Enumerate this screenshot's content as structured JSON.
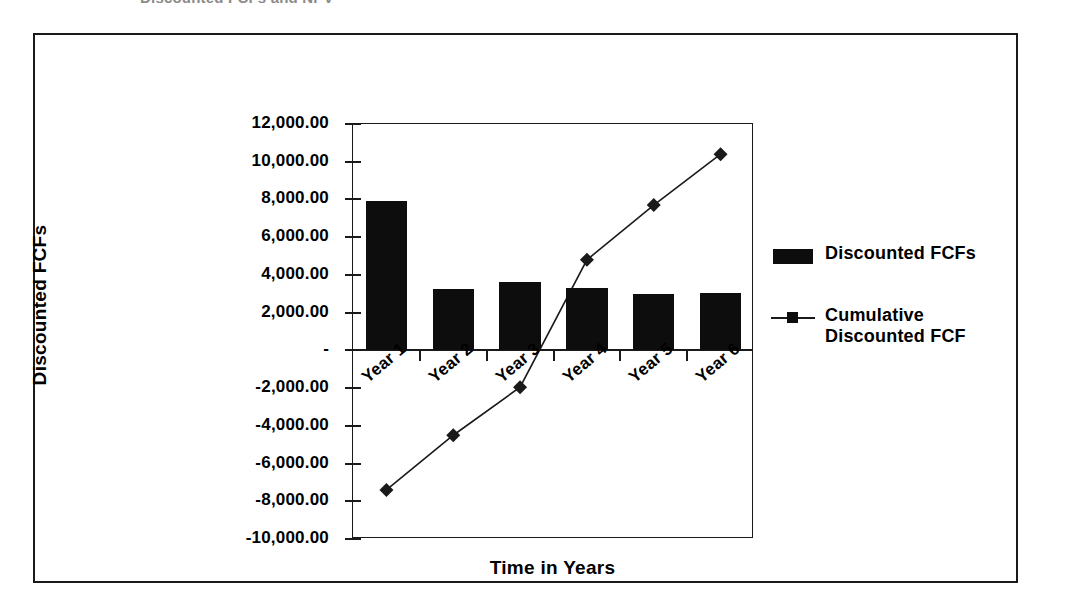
{
  "clipped_title": "Discounted FCFs and NPV",
  "chart_data": {
    "type": "bar",
    "title": "",
    "xlabel": "Time in Years",
    "ylabel": "Discounted FCFs",
    "categories": [
      "Year 1",
      "Year 2",
      "Year 3",
      "Year 4",
      "Year 5",
      "Year 6"
    ],
    "ylim": [
      -10000,
      12000
    ],
    "ytick_values": [
      12000,
      10000,
      8000,
      6000,
      4000,
      2000,
      0,
      -2000,
      -4000,
      -6000,
      -8000,
      -10000
    ],
    "ytick_labels": [
      "12,000.00",
      "10,000.00",
      "8,000.00",
      "6,000.00",
      "4,000.00",
      "2,000.00",
      "-",
      "-2,000.00",
      "-4,000.00",
      "-6,000.00",
      "-8,000.00",
      "-10,000.00"
    ],
    "grid": false,
    "legend_position": "right",
    "series": [
      {
        "name": "Discounted FCFs",
        "type": "bar",
        "color": "#0d0d0d",
        "values": [
          7900,
          3250,
          3650,
          3300,
          3000,
          3050
        ]
      },
      {
        "name": "Cumulative Discounted FCF",
        "type": "line",
        "color": "#1a1a1a",
        "marker": "diamond",
        "values": [
          -7400,
          -4500,
          -1950,
          4800,
          7700,
          10400
        ]
      }
    ]
  },
  "legend": {
    "entries": [
      {
        "label": "Discounted FCFs",
        "key": "bar-swatch"
      },
      {
        "label": "Cumulative Discounted FCF",
        "key": "line-marker"
      }
    ]
  }
}
